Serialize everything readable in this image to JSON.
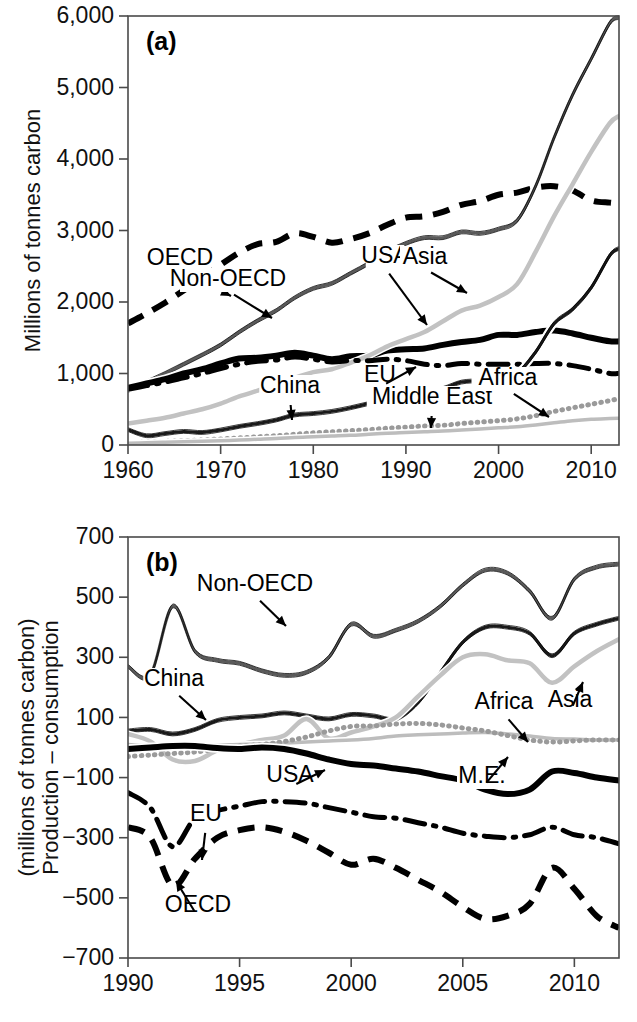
{
  "figure": {
    "background": "#ffffff",
    "width": 637,
    "height": 1022
  },
  "chart_data": [
    {
      "id": "panel-a",
      "type": "line",
      "panel_label": "(a)",
      "title": "",
      "xlabel": "",
      "ylabel": "Millions of tonnes carbon",
      "xlim": [
        1960,
        2013
      ],
      "ylim": [
        0,
        6000
      ],
      "xticks": [
        1960,
        1970,
        1980,
        1990,
        2000,
        2010
      ],
      "xticklabels": [
        "1960",
        "1970",
        "1980",
        "1990",
        "2000",
        "2010"
      ],
      "yticks": [
        0,
        1000,
        2000,
        3000,
        4000,
        5000,
        6000
      ],
      "yticklabels": [
        "0",
        "1,000",
        "2,000",
        "3,000",
        "4,000",
        "5,000",
        "6,000"
      ],
      "grid": false,
      "legend": "annotated-arrows",
      "x": [
        1960,
        1962,
        1964,
        1966,
        1968,
        1970,
        1972,
        1974,
        1976,
        1978,
        1980,
        1982,
        1984,
        1986,
        1988,
        1990,
        1992,
        1994,
        1996,
        1998,
        2000,
        2002,
        2004,
        2006,
        2008,
        2010,
        2012,
        2013
      ],
      "series": [
        {
          "name": "OECD",
          "style": "dashed",
          "color": "#000000",
          "width": 6,
          "values": [
            1700,
            1840,
            1990,
            2160,
            2330,
            2520,
            2690,
            2810,
            2840,
            2960,
            2910,
            2830,
            2880,
            2960,
            3080,
            3180,
            3200,
            3260,
            3360,
            3410,
            3500,
            3530,
            3600,
            3620,
            3560,
            3420,
            3390,
            3380
          ]
        },
        {
          "name": "Non-OECD",
          "style": "solid-outlined-gray",
          "color": "#5a5a5a",
          "width": 3,
          "values": [
            760,
            880,
            1000,
            1130,
            1260,
            1400,
            1580,
            1740,
            1880,
            2060,
            2190,
            2260,
            2400,
            2540,
            2700,
            2820,
            2900,
            2900,
            2980,
            2960,
            3020,
            3140,
            3620,
            4300,
            4900,
            5400,
            5900,
            5980
          ]
        },
        {
          "name": "USA",
          "style": "solid-thick-black",
          "color": "#000000",
          "width": 6,
          "values": [
            800,
            860,
            920,
            1000,
            1060,
            1140,
            1210,
            1220,
            1250,
            1290,
            1250,
            1200,
            1240,
            1250,
            1320,
            1340,
            1350,
            1400,
            1440,
            1470,
            1540,
            1540,
            1580,
            1600,
            1560,
            1500,
            1450,
            1450
          ]
        },
        {
          "name": "Asia",
          "style": "solid-light-gray",
          "color": "#c2c2c2",
          "width": 4.5,
          "values": [
            300,
            340,
            380,
            440,
            500,
            580,
            680,
            760,
            840,
            940,
            1020,
            1060,
            1150,
            1250,
            1380,
            1480,
            1580,
            1730,
            1880,
            1950,
            2070,
            2250,
            2700,
            3200,
            3650,
            4100,
            4500,
            4600
          ]
        },
        {
          "name": "EU",
          "style": "dash-dot",
          "color": "#000000",
          "width": 5,
          "values": [
            780,
            830,
            880,
            940,
            1000,
            1070,
            1130,
            1170,
            1190,
            1230,
            1200,
            1160,
            1180,
            1180,
            1200,
            1180,
            1130,
            1110,
            1140,
            1130,
            1130,
            1130,
            1140,
            1140,
            1110,
            1060,
            1000,
            1000
          ]
        },
        {
          "name": "China",
          "style": "solid-outlined-black",
          "color": "#1a1a1a",
          "width": 3,
          "values": [
            215,
            130,
            160,
            190,
            175,
            210,
            260,
            300,
            350,
            420,
            440,
            470,
            520,
            580,
            640,
            680,
            730,
            790,
            880,
            900,
            930,
            1000,
            1300,
            1700,
            1900,
            2200,
            2650,
            2750
          ]
        },
        {
          "name": "Africa",
          "style": "dotted",
          "color": "#9a9a9a",
          "width": 5,
          "values": [
            30,
            40,
            50,
            60,
            70,
            85,
            100,
            115,
            130,
            150,
            170,
            185,
            200,
            215,
            235,
            250,
            265,
            275,
            300,
            320,
            340,
            365,
            410,
            470,
            520,
            570,
            620,
            650
          ]
        },
        {
          "name": "Middle East",
          "style": "solid-light-gray-thin",
          "color": "#bdbdbd",
          "width": 3.5,
          "values": [
            25,
            30,
            38,
            45,
            52,
            60,
            70,
            80,
            90,
            105,
            115,
            125,
            135,
            150,
            165,
            175,
            185,
            195,
            210,
            225,
            240,
            255,
            280,
            310,
            340,
            360,
            370,
            375
          ]
        }
      ],
      "annotations": [
        {
          "label": "OECD",
          "lx": 180,
          "ly": 265,
          "ax": 231,
          "ay": 296
        },
        {
          "label": "Non-OECD",
          "lx": 228,
          "ly": 286,
          "ax": 272,
          "ay": 318
        },
        {
          "label": "USA",
          "lx": 385,
          "ly": 263,
          "ax": 427,
          "ay": 325
        },
        {
          "label": "Asia",
          "lx": 425,
          "ly": 264,
          "ax": 467,
          "ay": 293
        },
        {
          "label": "EU",
          "lx": 380,
          "ly": 382,
          "ax": 416,
          "ay": 367
        },
        {
          "label": "China",
          "lx": 290,
          "ly": 393,
          "ax": 292,
          "ay": 420
        },
        {
          "label": "Middle East",
          "lx": 432,
          "ly": 404,
          "ax": 431,
          "ay": 428
        },
        {
          "label": "Africa",
          "lx": 508,
          "ly": 385,
          "ax": 549,
          "ay": 417
        }
      ]
    },
    {
      "id": "panel-b",
      "type": "line",
      "panel_label": "(b)",
      "title": "",
      "xlabel": "",
      "ylabel": "Production – consumption\n(millions of tonnes carbon)",
      "ylabel_line1": "Production – consumption",
      "ylabel_line2": "(millions of tonnes carbon)",
      "xlim": [
        1990,
        2012
      ],
      "ylim": [
        -700,
        700
      ],
      "xticks": [
        1990,
        1995,
        2000,
        2005,
        2010
      ],
      "xticklabels": [
        "1990",
        "1995",
        "2000",
        "2005",
        "2010"
      ],
      "yticks": [
        -700,
        -500,
        -300,
        -100,
        100,
        300,
        500,
        700
      ],
      "yticklabels": [
        "−700",
        "−500",
        "−300",
        "−100",
        "100",
        "300",
        "500",
        "700"
      ],
      "grid": false,
      "legend": "annotated-arrows",
      "x": [
        1990,
        1991,
        1992,
        1993,
        1994,
        1995,
        1996,
        1997,
        1998,
        1999,
        2000,
        2001,
        2002,
        2003,
        2004,
        2005,
        2006,
        2007,
        2008,
        2009,
        2010,
        2011,
        2012
      ],
      "series": [
        {
          "name": "Non-OECD",
          "style": "solid-outlined-gray",
          "color": "#5a5a5a",
          "width": 3,
          "values": [
            270,
            240,
            470,
            320,
            290,
            280,
            255,
            240,
            250,
            300,
            410,
            370,
            390,
            420,
            470,
            540,
            590,
            580,
            520,
            430,
            560,
            600,
            610
          ]
        },
        {
          "name": "China",
          "style": "solid-outlined-black",
          "color": "#1a1a1a",
          "width": 3,
          "values": [
            55,
            60,
            45,
            60,
            90,
            100,
            105,
            115,
            105,
            95,
            110,
            105,
            95,
            150,
            250,
            350,
            400,
            400,
            380,
            305,
            380,
            410,
            430
          ]
        },
        {
          "name": "Asia",
          "style": "solid-light-gray",
          "color": "#c2c2c2",
          "width": 4.5,
          "values": [
            45,
            20,
            -40,
            -45,
            -10,
            10,
            25,
            40,
            95,
            30,
            50,
            70,
            100,
            170,
            240,
            300,
            310,
            290,
            280,
            215,
            270,
            320,
            360
          ]
        },
        {
          "name": "Africa",
          "style": "solid-light-gray-thin",
          "color": "#bdbdbd",
          "width": 3.5,
          "values": [
            10,
            5,
            0,
            5,
            8,
            10,
            12,
            15,
            18,
            22,
            25,
            30,
            38,
            42,
            45,
            48,
            50,
            45,
            38,
            30,
            28,
            25,
            25
          ]
        },
        {
          "name": "M.E.",
          "style": "dotted",
          "color": "#9a9a9a",
          "width": 5,
          "values": [
            -30,
            -25,
            -20,
            -15,
            -5,
            5,
            10,
            20,
            35,
            55,
            70,
            72,
            78,
            80,
            75,
            65,
            55,
            40,
            25,
            18,
            22,
            25,
            25
          ]
        },
        {
          "name": "USA",
          "style": "solid-thick-black",
          "color": "#000000",
          "width": 6,
          "values": [
            -5,
            0,
            5,
            5,
            -2,
            -5,
            0,
            -5,
            -20,
            -40,
            -55,
            -60,
            -70,
            -80,
            -95,
            -110,
            -140,
            -155,
            -140,
            -80,
            -85,
            -100,
            -110
          ]
        },
        {
          "name": "EU",
          "style": "dash-dot",
          "color": "#000000",
          "width": 5,
          "values": [
            -150,
            -200,
            -330,
            -235,
            -210,
            -195,
            -180,
            -180,
            -185,
            -200,
            -215,
            -230,
            -235,
            -250,
            -265,
            -285,
            -295,
            -300,
            -290,
            -265,
            -290,
            -300,
            -320
          ]
        },
        {
          "name": "OECD",
          "style": "dashed",
          "color": "#000000",
          "width": 6,
          "values": [
            -265,
            -300,
            -460,
            -370,
            -300,
            -275,
            -265,
            -280,
            -310,
            -350,
            -390,
            -370,
            -400,
            -440,
            -480,
            -530,
            -570,
            -560,
            -520,
            -400,
            -470,
            -560,
            -600
          ]
        }
      ],
      "annotations": [
        {
          "label": "Non-OECD",
          "lx": 255,
          "ly": 591,
          "ax": 286,
          "ay": 626
        },
        {
          "label": "China",
          "lx": 174,
          "ly": 686,
          "ax": 206,
          "ay": 720
        },
        {
          "label": "Asia",
          "lx": 570,
          "ly": 707,
          "ax": 583,
          "ay": 682
        },
        {
          "label": "Africa",
          "lx": 504,
          "ly": 709,
          "ax": 528,
          "ay": 742
        },
        {
          "label": "M.E.",
          "lx": 482,
          "ly": 783,
          "ax": 508,
          "ay": 757
        },
        {
          "label": "USA",
          "lx": 290,
          "ly": 782,
          "ax": 325,
          "ay": 770
        },
        {
          "label": "EU",
          "lx": 206,
          "ly": 821,
          "ax": 202,
          "ay": 860
        },
        {
          "label": "OECD",
          "lx": 198,
          "ly": 912,
          "ax": 176,
          "ay": 881
        }
      ]
    }
  ]
}
